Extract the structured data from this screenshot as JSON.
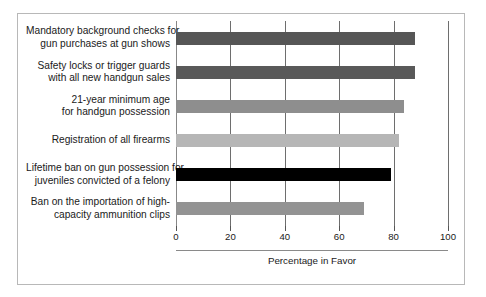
{
  "chart_data": {
    "type": "bar",
    "orientation": "horizontal",
    "title": "",
    "xlabel": "Percentage in Favor",
    "ylabel": "",
    "xlim": [
      0,
      100
    ],
    "xticks": [
      0,
      20,
      40,
      60,
      80,
      100
    ],
    "grid": true,
    "legend": null,
    "categories": [
      "Mandatory background checks for gun purchases at gun shows",
      "Safety locks or trigger guards with all new handgun sales",
      "21-year minimum age for handgun possession",
      "Registration of all firearms",
      "Lifetime ban on gun possession for juveniles convicted of a felony",
      "Ban on the importation of high-capacity ammunition clips"
    ],
    "category_lines": [
      [
        "Mandatory background checks for",
        "gun purchases at gun shows"
      ],
      [
        "Safety locks or trigger guards",
        "with all new handgun sales"
      ],
      [
        "21-year minimum age",
        "for handgun possession"
      ],
      [
        "Registration of all firearms"
      ],
      [
        "Lifetime ban on gun possession for",
        "juveniles convicted of a felony"
      ],
      [
        "Ban on the importation of high-",
        "capacity ammunition clips"
      ]
    ],
    "values": [
      88,
      88,
      84,
      82,
      79,
      69
    ],
    "bar_colors": [
      "#565656",
      "#595959",
      "#8e8e8e",
      "#b6b6b6",
      "#000000",
      "#939393"
    ]
  },
  "colors": {
    "frame_border": "#b8b8b8",
    "gridline": "#6e6e6e",
    "text": "#1a1a1a",
    "background": "#ffffff"
  }
}
